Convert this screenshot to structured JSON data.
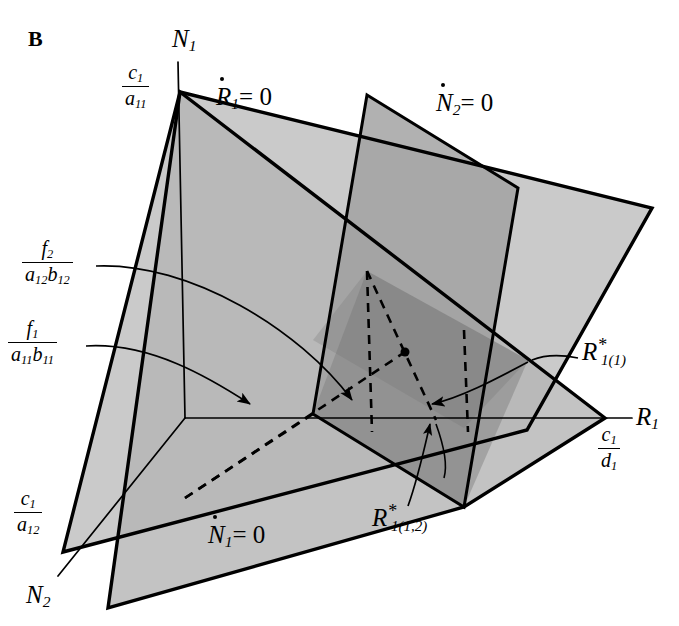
{
  "figure": {
    "panel_label": "B",
    "type": "3d-nullcline-phase-diagram",
    "background_color": "#ffffff",
    "plane_fill_light": "#c8c8c8",
    "plane_fill_mid": "#a8a8a8",
    "plane_fill_dark": "#8a8a8a",
    "line_color": "#000000"
  },
  "axes": [
    {
      "id": "n1",
      "label": "N",
      "sub": "1",
      "x": 172,
      "y": 40
    },
    {
      "id": "r1",
      "label": "R",
      "sub": "1",
      "x": 636,
      "y": 405
    },
    {
      "id": "n2",
      "label": "N",
      "sub": "2",
      "x": 26,
      "y": 584
    }
  ],
  "nullclines": [
    {
      "id": "rdot1",
      "symbol": "R",
      "sub": "1",
      "equals": "= 0",
      "x": 218,
      "y": 86
    },
    {
      "id": "ndot2",
      "symbol": "N",
      "sub": "2",
      "equals": "= 0",
      "x": 438,
      "y": 92
    },
    {
      "id": "ndot1",
      "symbol": "N",
      "sub": "1",
      "equals": "= 0",
      "x": 210,
      "y": 524
    }
  ],
  "intercepts": [
    {
      "id": "c1-over-a11",
      "numerator": "c",
      "numerator_sub": "1",
      "denominator": "a",
      "denominator_sub": "11",
      "x": 122,
      "y": 68
    },
    {
      "id": "f2-over-a12b12",
      "numerator": "f",
      "numerator_sub": "2",
      "denominator_a": "a",
      "denominator_a_sub": "12",
      "denominator_b": "b",
      "denominator_b_sub": "12",
      "x": 25,
      "y": 244
    },
    {
      "id": "f1-over-a11b11",
      "numerator": "f",
      "numerator_sub": "1",
      "denominator_a": "a",
      "denominator_a_sub": "11",
      "denominator_b": "b",
      "denominator_b_sub": "11",
      "x": 10,
      "y": 324
    },
    {
      "id": "c1-over-a12",
      "numerator": "c",
      "numerator_sub": "1",
      "denominator": "a",
      "denominator_sub": "12",
      "x": 14,
      "y": 494
    },
    {
      "id": "c1-over-d1",
      "numerator": "c",
      "numerator_sub": "1",
      "denominator": "d",
      "denominator_sub": "1",
      "x": 598,
      "y": 428
    }
  ],
  "equilibria": [
    {
      "id": "r1-star-1",
      "symbol": "R",
      "star": "*",
      "index": "1(1)",
      "x": 584,
      "y": 347,
      "point_x": 528,
      "point_y": 360
    },
    {
      "id": "r1-star-1-2",
      "symbol": "R",
      "star": "*",
      "index": "1(1,2)",
      "x": 376,
      "y": 512,
      "point_x": 436,
      "point_y": 420
    }
  ],
  "equilibrium_dot": {
    "x": 405,
    "y": 352,
    "r": 4.5
  }
}
